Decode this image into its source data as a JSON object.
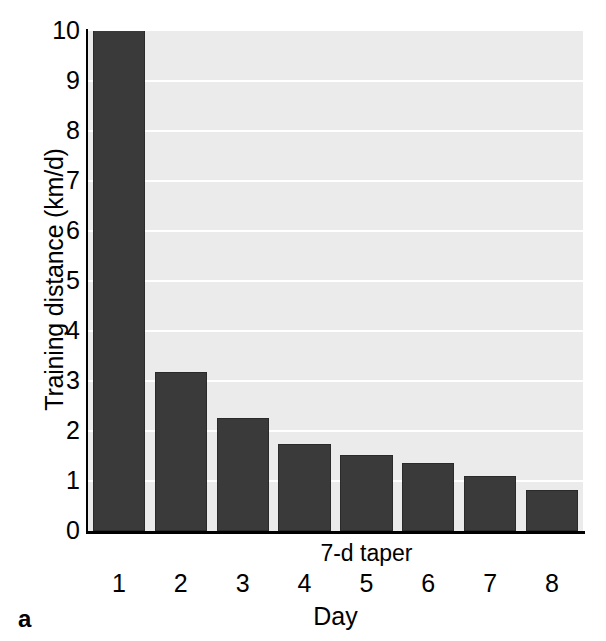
{
  "panel": {
    "label": "a"
  },
  "chart_data": {
    "type": "bar",
    "title": "",
    "xlabel": "Day",
    "ylabel": "Training distance (km/d)",
    "categories": [
      "1",
      "2",
      "3",
      "4",
      "5",
      "6",
      "7",
      "8"
    ],
    "values": [
      10.1,
      3.18,
      2.26,
      1.74,
      1.52,
      1.36,
      1.1,
      0.82
    ],
    "ylim": [
      0,
      10
    ],
    "yticks": [
      "10",
      "9",
      "8",
      "7",
      "6",
      "5",
      "4",
      "3",
      "2",
      "1",
      "0"
    ],
    "ytick_values": [
      10,
      9,
      8,
      7,
      6,
      5,
      4,
      3,
      2,
      1,
      0
    ],
    "grid": "horizontal",
    "legend": "none",
    "annotations": [
      {
        "text": "7-d taper",
        "type": "double-arrow",
        "from_category": "2",
        "to_category": "8"
      }
    ],
    "colors": {
      "bar_fill": "#3a3a3a",
      "plot_background": "#ebebeb",
      "gridline": "#ffffff",
      "axis": "#000000",
      "text": "#000000"
    }
  }
}
